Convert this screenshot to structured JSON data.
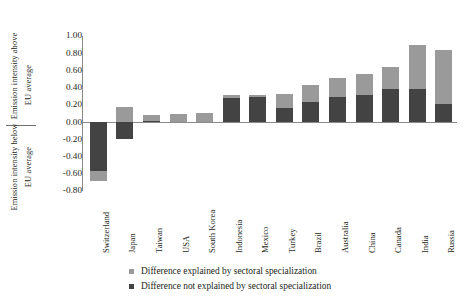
{
  "chart_data": {
    "type": "bar",
    "title": "",
    "subtitle": "",
    "xlabel": "",
    "ylabel_above": "Emission intensity above",
    "ylabel_above_2": "EU average",
    "ylabel_below": "Emission intensity below",
    "ylabel_below_2": "EU average",
    "grid": false,
    "stacked": true,
    "legend_position": "bottom",
    "ylim": [
      -0.8,
      1.0
    ],
    "ytick_values": [
      1.0,
      0.8,
      0.6,
      0.4,
      0.2,
      0.0,
      -0.2,
      -0.4,
      -0.6,
      -0.8
    ],
    "ytick_labels": [
      "1.00",
      "0.80",
      "0.60",
      "0.40",
      "0.20",
      "0.00",
      "-0.20",
      "-0.40",
      "-0.60",
      "-0.80"
    ],
    "categories": [
      "Switzerland",
      "Japan",
      "Taiwan",
      "USA",
      "South Korea",
      "Indonesia",
      "Mexico",
      "Turkey",
      "Brazil",
      "Australia",
      "China",
      "Canada",
      "India",
      "Russia"
    ],
    "series": [
      {
        "name": "Difference explained by sectoral specialization",
        "color": "#9a9a9a",
        "values": [
          -0.11,
          0.18,
          0.07,
          0.1,
          0.11,
          0.03,
          0.03,
          0.17,
          0.2,
          0.22,
          0.25,
          0.25,
          0.51,
          0.63
        ]
      },
      {
        "name": "Difference not explained by sectoral specialization",
        "color": "#434343",
        "values": [
          -0.57,
          -0.2,
          0.01,
          0.0,
          0.0,
          0.28,
          0.29,
          0.16,
          0.23,
          0.29,
          0.31,
          0.39,
          0.38,
          0.21
        ]
      }
    ],
    "totals": [
      -0.68,
      -0.02,
      0.08,
      0.1,
      0.11,
      0.31,
      0.32,
      0.33,
      0.43,
      0.51,
      0.56,
      0.64,
      0.89,
      0.84
    ]
  },
  "legend": {
    "items": [
      {
        "label": "Difference explained by sectoral specialization",
        "color": "#9a9a9a"
      },
      {
        "label": "Difference not explained by sectoral specialization",
        "color": "#434343"
      }
    ]
  },
  "colors": {
    "explained": "#9a9a9a",
    "not_explained": "#434343",
    "axis": "#8a8a8a",
    "text": "#231f20",
    "background": "#ffffff"
  }
}
